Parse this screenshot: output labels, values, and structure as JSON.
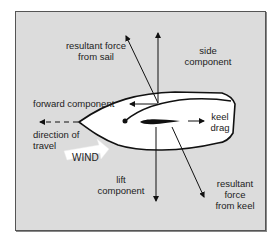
{
  "diagram": {
    "colors": {
      "background": "#dcdcdc",
      "hull": "#ffffff",
      "ink": "#111111",
      "wind_arrow": "#ffffff"
    },
    "labels": {
      "resultant_sail_line1": "resultant force",
      "resultant_sail_line2": "from sail",
      "side_line1": "side",
      "side_line2": "component",
      "forward": "forward component",
      "keel_line1": "keel",
      "keel_line2": "drag",
      "direction_line1": "direction of",
      "direction_line2": "travel",
      "wind": "WIND",
      "lift_line1": "lift",
      "lift_line2": "component",
      "resultant_keel_line1": "resultant",
      "resultant_keel_line2": "force",
      "resultant_keel_line3": "from keel"
    }
  }
}
